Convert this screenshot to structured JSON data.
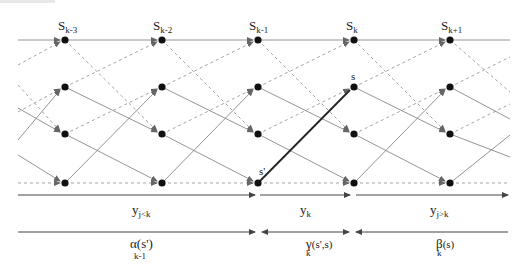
{
  "diagram": {
    "stage_labels": [
      {
        "base": "S",
        "sub": "k-3"
      },
      {
        "base": "S",
        "sub": "k-2"
      },
      {
        "base": "S",
        "sub": "k-1"
      },
      {
        "base": "S",
        "sub": "k"
      },
      {
        "base": "S",
        "sub": "k+1"
      }
    ],
    "state_labels": {
      "s": "s",
      "s_prime": "s'"
    },
    "num_states": 4,
    "num_stages": 5,
    "highlighted_transition": {
      "from_stage": "S_k-1",
      "from_state": 3,
      "to_stage": "S_k",
      "to_state": 1,
      "from_label": "s'",
      "to_label": "s"
    },
    "observation_axis": [
      {
        "base": "y",
        "sub": "j<k"
      },
      {
        "base": "y",
        "sub": "k"
      },
      {
        "base": "y",
        "sub": "j>k"
      }
    ],
    "metric_axis": [
      {
        "base": "α(s')",
        "sub": "k-1"
      },
      {
        "base": "γ",
        "sub": "k",
        "suffix": "(s',s)"
      },
      {
        "base": "β",
        "sub": "k",
        "suffix": "(s)"
      }
    ],
    "legend": {
      "solid_edge": "solid transition",
      "dashed_edge": "dashed transition",
      "bold_edge": "transition s' → s"
    },
    "colors": {
      "node": "#111111",
      "edge_solid": "#888888",
      "edge_dashed": "#999999",
      "edge_highlight": "#222222"
    }
  }
}
